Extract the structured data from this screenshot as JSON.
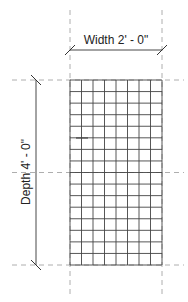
{
  "drawing": {
    "width_dimension": {
      "label": "Width 2' - 0\""
    },
    "depth_dimension": {
      "label": "Depth 4' - 0\""
    },
    "grid": {
      "columns": 8,
      "rows": 16
    },
    "colors": {
      "line": "#444444",
      "reference_plane": "#888888",
      "text": "#222222"
    }
  }
}
